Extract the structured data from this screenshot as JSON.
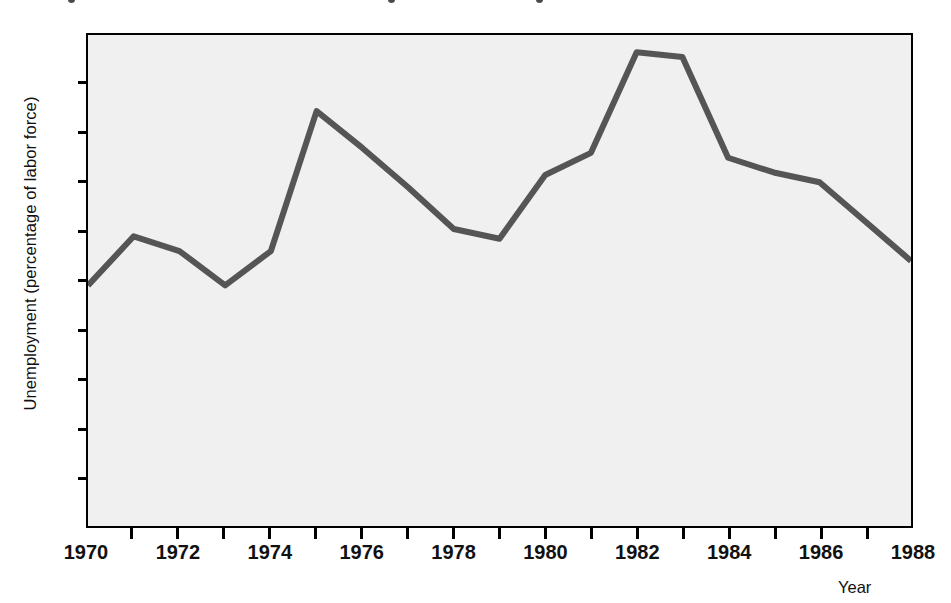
{
  "figure": {
    "top_artifact_positions": [
      68,
      388,
      536
    ],
    "background_color": "#ffffff",
    "plot_background_color": "#f0f0f0",
    "axis_color": "#000000",
    "line_color": "#555555"
  },
  "chart_data": {
    "type": "line",
    "title": "",
    "subtitle": "",
    "xlabel": "Year",
    "ylabel": "Unemployment (percentage of labor force)",
    "xlim": [
      1970,
      1988
    ],
    "ylim": [
      0,
      10
    ],
    "grid": false,
    "legend": false,
    "x_tick_labels": [
      "1970",
      "1972",
      "1974",
      "1976",
      "1978",
      "1980",
      "1982",
      "1984",
      "1986",
      "1988"
    ],
    "x_tick_values": [
      1970,
      1972,
      1974,
      1976,
      1978,
      1980,
      1982,
      1984,
      1986,
      1988
    ],
    "x_minor_ticks": [
      1971,
      1973,
      1975,
      1977,
      1979,
      1981,
      1983,
      1985,
      1987
    ],
    "y_tick_labels": [
      "0",
      "1",
      "2",
      "3",
      "4",
      "5",
      "6",
      "7",
      "8",
      "9",
      "10"
    ],
    "y_tick_values": [
      0,
      1,
      2,
      3,
      4,
      5,
      6,
      7,
      8,
      9,
      10
    ],
    "x": [
      1970,
      1971,
      1972,
      1973,
      1974,
      1975,
      1976,
      1977,
      1978,
      1979,
      1980,
      1981,
      1982,
      1983,
      1984,
      1985,
      1986,
      1987,
      1988
    ],
    "values": [
      4.9,
      5.9,
      5.6,
      4.9,
      5.6,
      8.45,
      7.7,
      6.9,
      6.05,
      5.85,
      7.15,
      7.6,
      9.65,
      9.55,
      7.5,
      7.2,
      7.0,
      6.2,
      5.4
    ],
    "series": [
      {
        "name": "Unemployment rate",
        "values": [
          4.9,
          5.9,
          5.6,
          4.9,
          5.6,
          8.45,
          7.7,
          6.9,
          6.05,
          5.85,
          7.15,
          7.6,
          9.65,
          9.55,
          7.5,
          7.2,
          7.0,
          6.2,
          5.4
        ]
      }
    ]
  }
}
